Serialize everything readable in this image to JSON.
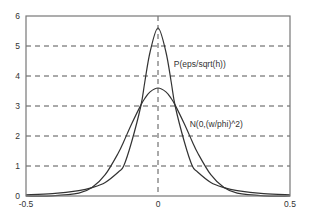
{
  "chart_data": {
    "type": "line",
    "title": "",
    "xlabel": "",
    "ylabel": "",
    "xlim": [
      -0.5,
      0.5
    ],
    "ylim": [
      0,
      6
    ],
    "grid": "dashed, horizontal at y=1..5 and vertical at x=0",
    "x_ticks": [
      "-0.5",
      "0",
      "0.5"
    ],
    "y_ticks": [
      "0",
      "1",
      "2",
      "3",
      "4",
      "5",
      "6"
    ],
    "x": [
      -0.5,
      -0.4,
      -0.3,
      -0.25,
      -0.2,
      -0.15,
      -0.13,
      -0.1,
      -0.065,
      -0.05,
      -0.03,
      0,
      0.03,
      0.05,
      0.065,
      0.1,
      0.13,
      0.15,
      0.2,
      0.25,
      0.3,
      0.4,
      0.5
    ],
    "series": [
      {
        "name": "P(eps/sqrt(h))",
        "values": [
          0.04,
          0.08,
          0.18,
          0.28,
          0.45,
          0.8,
          1.0,
          1.8,
          3.0,
          3.8,
          4.8,
          5.6,
          4.8,
          3.8,
          3.0,
          1.8,
          1.0,
          0.8,
          0.45,
          0.28,
          0.18,
          0.08,
          0.04
        ]
      },
      {
        "name": "N(0,(w/phi)^2)",
        "values": [
          0.0,
          0.006,
          0.093,
          0.28,
          0.71,
          1.44,
          1.81,
          2.4,
          3.03,
          3.25,
          3.47,
          3.6,
          3.47,
          3.25,
          3.03,
          2.4,
          1.81,
          1.44,
          0.71,
          0.28,
          0.093,
          0.006,
          0.0
        ]
      }
    ],
    "annotations": [
      {
        "text": "P(eps/sqrt(h))",
        "x": 0.06,
        "y": 4.4
      },
      {
        "text": "N(0,(w/phi)^2)",
        "x": 0.12,
        "y": 2.4
      }
    ],
    "colors": {
      "curve": "#333333",
      "grid": "#555555",
      "frame": "#777777"
    }
  }
}
